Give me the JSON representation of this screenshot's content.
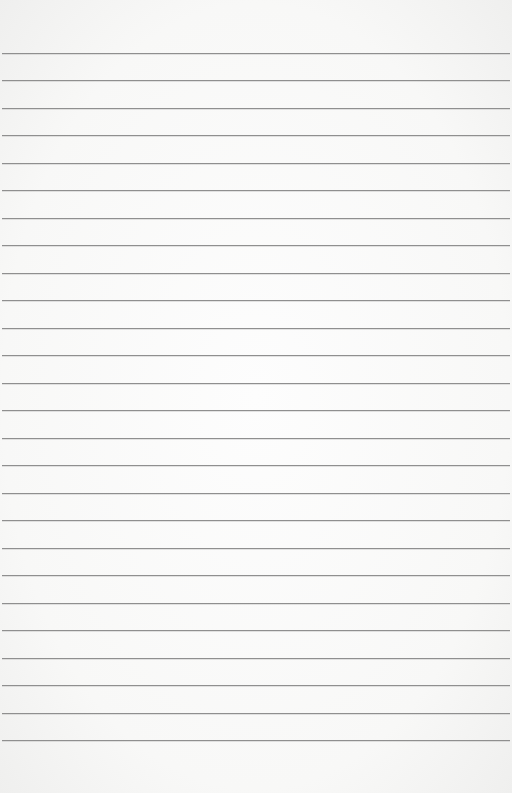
{
  "page": {
    "type": "lined-paper",
    "background_color": "#fbfbfa",
    "rule_color": "#8f8f8f",
    "rule_count": 26,
    "first_rule_y": 53,
    "rule_spacing": 27.48,
    "text_content": ""
  }
}
